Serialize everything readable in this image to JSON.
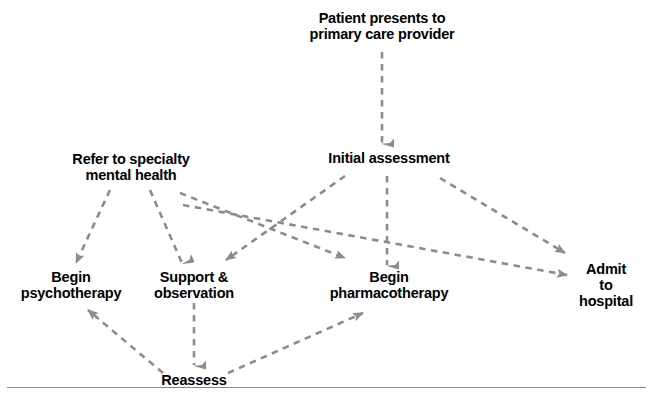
{
  "diagram": {
    "style": {
      "edge_color": "#8c8c8c",
      "text_color": "#000000",
      "background": "#ffffff",
      "edge_style": "dashed",
      "arrowhead": "solid-triangle",
      "rule_color": "#8a8a8a"
    },
    "nodes": [
      {
        "id": "patient",
        "label": "Patient presents to\nprimary care provider",
        "x": 382,
        "y": 26
      },
      {
        "id": "refer",
        "label": "Refer to specialty\nmental health",
        "x": 131,
        "y": 167
      },
      {
        "id": "assessment",
        "label": "Initial assessment",
        "x": 389,
        "y": 158
      },
      {
        "id": "psychotherapy",
        "label": "Begin\npsychotherapy",
        "x": 71,
        "y": 285
      },
      {
        "id": "support",
        "label": "Support &\nobservation",
        "x": 194,
        "y": 285
      },
      {
        "id": "pharmacotherapy",
        "label": "Begin\npharmacotherapy",
        "x": 389,
        "y": 285
      },
      {
        "id": "admit",
        "label": "Admit to\nhospital",
        "x": 606,
        "y": 285
      },
      {
        "id": "reassess",
        "label": "Reassess",
        "x": 194,
        "y": 380
      }
    ],
    "edges": [
      {
        "from": "patient",
        "to": "assessment",
        "x1": 382,
        "y1": 52,
        "x2": 382,
        "y2": 143
      },
      {
        "from": "refer",
        "to": "psychotherapy",
        "x1": 110,
        "y1": 190,
        "x2": 76,
        "y2": 263
      },
      {
        "from": "refer",
        "to": "support",
        "x1": 150,
        "y1": 190,
        "x2": 182,
        "y2": 263
      },
      {
        "from": "refer",
        "to": "pharmacotherapy",
        "x1": 180,
        "y1": 193,
        "x2": 345,
        "y2": 258
      },
      {
        "from": "refer",
        "to": "admit",
        "x1": 183,
        "y1": 205,
        "x2": 567,
        "y2": 275
      },
      {
        "from": "assessment",
        "to": "pharmacotherapy",
        "x1": 387,
        "y1": 176,
        "x2": 387,
        "y2": 265
      },
      {
        "from": "assessment",
        "to": "support",
        "x1": 345,
        "y1": 176,
        "x2": 226,
        "y2": 260
      },
      {
        "from": "assessment",
        "to": "admit",
        "x1": 440,
        "y1": 178,
        "x2": 565,
        "y2": 253
      },
      {
        "from": "support",
        "to": "reassess",
        "x1": 194,
        "y1": 303,
        "x2": 194,
        "y2": 365
      },
      {
        "from": "reassess",
        "to": "psychotherapy",
        "x1": 163,
        "y1": 373,
        "x2": 88,
        "y2": 310
      },
      {
        "from": "reassess",
        "to": "pharmacotherapy",
        "x1": 228,
        "y1": 373,
        "x2": 363,
        "y2": 313
      }
    ],
    "rule": {
      "y": 387
    }
  }
}
